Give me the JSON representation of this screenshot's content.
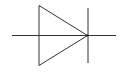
{
  "diagram": {
    "symbol": "diode",
    "colors": {
      "background": "#ffffff",
      "stroke": "#333333"
    },
    "parts": [
      "anode-lead",
      "triangle-anode",
      "cathode-bar",
      "cathode-lead"
    ]
  }
}
